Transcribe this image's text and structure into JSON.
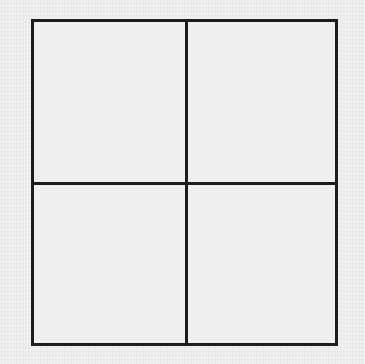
{
  "diagram": {
    "type": "grid",
    "rows": 2,
    "columns": 2,
    "cells": [
      {
        "row": 1,
        "col": 1,
        "label": ""
      },
      {
        "row": 1,
        "col": 2,
        "label": ""
      },
      {
        "row": 2,
        "col": 1,
        "label": ""
      },
      {
        "row": 2,
        "col": 2,
        "label": ""
      }
    ],
    "colors": {
      "background": "#ececec",
      "line": "#1c1c1c"
    }
  }
}
